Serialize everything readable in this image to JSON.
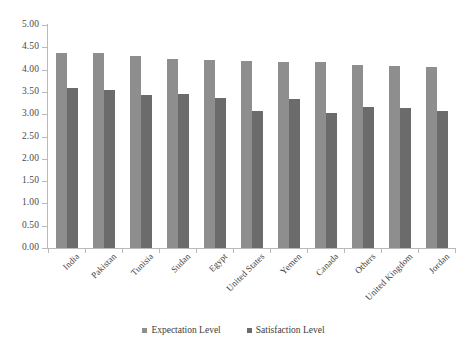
{
  "chart_data": {
    "type": "bar",
    "title": "",
    "subtitle": "",
    "xlabel": "",
    "ylabel": "",
    "ylim": [
      0,
      5
    ],
    "ytick_step": 0.5,
    "ytick_labels": [
      "0.00",
      "0.50",
      "1.00",
      "1.50",
      "2.00",
      "2.50",
      "3.00",
      "3.50",
      "4.00",
      "4.50",
      "5.00"
    ],
    "grid": false,
    "legend_position": "bottom-center",
    "categories": [
      "India",
      "Pakistan",
      "Tunisia",
      "Sudan",
      "Egypt",
      "United States",
      "Yemen",
      "Canada",
      "Others",
      "United Kingdom",
      "Jordan"
    ],
    "series": [
      {
        "name": "Expectation Level",
        "color": "#8e8e8e",
        "values": [
          4.38,
          4.37,
          4.3,
          4.24,
          4.21,
          4.2,
          4.18,
          4.16,
          4.11,
          4.08,
          4.05
        ]
      },
      {
        "name": "Satisfaction Level",
        "color": "#6b6b6b",
        "values": [
          3.58,
          3.54,
          3.44,
          3.46,
          3.37,
          3.07,
          3.33,
          3.03,
          3.16,
          3.13,
          3.08
        ]
      }
    ]
  },
  "legend": {
    "items": [
      {
        "label": "Expectation Level",
        "color": "#8e8e8e"
      },
      {
        "label": "Satisfaction Level",
        "color": "#6b6b6b"
      }
    ]
  }
}
